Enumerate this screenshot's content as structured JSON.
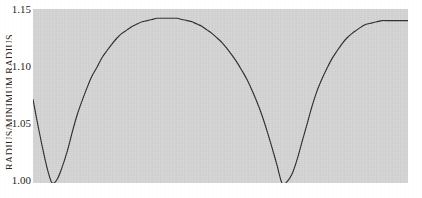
{
  "figure": {
    "background_color": "#ffffff",
    "panel_color": "#d4d4d4",
    "curve_color": "#2a2a2a",
    "tick_text_color": "#1f1f1f"
  },
  "axis": {
    "y_label": "RADIUS/MINIMUM RADIUS",
    "y_ticks": [
      {
        "label": "1.15",
        "value": 1.15
      },
      {
        "label": "1.10",
        "value": 1.1
      },
      {
        "label": "1.05",
        "value": 1.05
      },
      {
        "label": "1.00",
        "value": 1.0
      }
    ]
  },
  "chart_data": {
    "type": "line",
    "title": "",
    "subtitle": "",
    "xlabel": "",
    "ylabel": "RADIUS/MINIMUM RADIUS",
    "legend": [],
    "legend_position": "none",
    "grid": false,
    "xlim": [
      0,
      1
    ],
    "ylim": [
      1.0,
      1.15
    ],
    "y_ticks": [
      1.0,
      1.05,
      1.1,
      1.15
    ],
    "y_tick_labels": [
      "1.00",
      "1.05",
      "1.10",
      "1.15"
    ],
    "x_ticks": [],
    "x_tick_labels": [],
    "annotations": [
      {
        "text": "minimum",
        "x": 0.051,
        "y": 1.0
      },
      {
        "text": "maximum",
        "x": 0.379,
        "y": 1.142
      },
      {
        "text": "minimum",
        "x": 0.664,
        "y": 1.0
      }
    ],
    "series": [
      {
        "name": "radius ratio",
        "x": [
          0.0,
          0.013,
          0.027,
          0.04,
          0.051,
          0.064,
          0.077,
          0.091,
          0.104,
          0.117,
          0.131,
          0.144,
          0.157,
          0.171,
          0.184,
          0.197,
          0.211,
          0.224,
          0.237,
          0.251,
          0.264,
          0.277,
          0.291,
          0.304,
          0.317,
          0.331,
          0.344,
          0.357,
          0.371,
          0.384,
          0.397,
          0.411,
          0.424,
          0.437,
          0.451,
          0.464,
          0.477,
          0.491,
          0.504,
          0.517,
          0.531,
          0.544,
          0.557,
          0.571,
          0.584,
          0.597,
          0.611,
          0.624,
          0.637,
          0.651,
          0.664,
          0.677,
          0.691,
          0.704,
          0.717,
          0.731,
          0.744,
          0.757,
          0.771,
          0.784,
          0.797,
          0.811,
          0.824,
          0.837,
          0.851,
          0.864,
          0.877,
          0.891,
          0.904,
          0.917,
          0.931,
          0.944,
          0.957,
          0.971,
          0.984,
          1.0
        ],
        "y": [
          1.072,
          1.05,
          1.028,
          1.01,
          1.0,
          1.003,
          1.013,
          1.027,
          1.043,
          1.058,
          1.071,
          1.082,
          1.092,
          1.1,
          1.108,
          1.114,
          1.12,
          1.125,
          1.129,
          1.132,
          1.135,
          1.137,
          1.139,
          1.14,
          1.141,
          1.142,
          1.142,
          1.142,
          1.142,
          1.142,
          1.141,
          1.14,
          1.139,
          1.137,
          1.135,
          1.132,
          1.129,
          1.125,
          1.121,
          1.116,
          1.11,
          1.104,
          1.097,
          1.089,
          1.08,
          1.07,
          1.058,
          1.045,
          1.031,
          1.015,
          1.0,
          1.001,
          1.008,
          1.02,
          1.035,
          1.051,
          1.066,
          1.079,
          1.09,
          1.099,
          1.107,
          1.114,
          1.12,
          1.125,
          1.129,
          1.132,
          1.135,
          1.137,
          1.138,
          1.139,
          1.14,
          1.14,
          1.14,
          1.14,
          1.14,
          1.14
        ]
      }
    ]
  }
}
